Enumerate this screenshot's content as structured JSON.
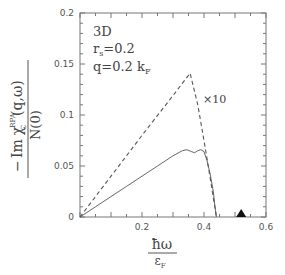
{
  "chart_data": {
    "type": "line",
    "title": "",
    "xlabel": "ħω / ε_F",
    "ylabel": "− Im χ_C^RPA (q,ω) / N(0)",
    "xlim": [
      0,
      0.6
    ],
    "ylim": [
      0,
      0.2
    ],
    "grid": false,
    "x_ticks": [
      "0.2",
      "0.4",
      "0.6"
    ],
    "y_ticks": [
      "0",
      "0.05",
      "0.1",
      "0.15",
      "0.2"
    ],
    "annotations": {
      "line1": "3D",
      "line2_base": "r",
      "line2_sub": "s",
      "line2_rest": "=0.2",
      "line3_base": "q=0.2  k",
      "line3_sub": "F",
      "scale_label": "×10"
    },
    "series": [
      {
        "name": "RPA (solid)",
        "style": "solid",
        "x": [
          0,
          0.05,
          0.1,
          0.15,
          0.2,
          0.25,
          0.3,
          0.33,
          0.345,
          0.36,
          0.37,
          0.38,
          0.39,
          0.4,
          0.41,
          0.42,
          0.43,
          0.435,
          0.44
        ],
        "y": [
          0,
          0.01,
          0.02,
          0.03,
          0.04,
          0.05,
          0.06,
          0.065,
          0.066,
          0.064,
          0.063,
          0.065,
          0.066,
          0.064,
          0.055,
          0.042,
          0.025,
          0.012,
          0
        ]
      },
      {
        "name": "×10 (dashed)",
        "style": "dashed",
        "x": [
          0,
          0.1,
          0.2,
          0.3,
          0.355,
          0.38,
          0.4,
          0.42,
          0.44
        ],
        "y": [
          0,
          0.04,
          0.08,
          0.119,
          0.141,
          0.11,
          0.075,
          0.038,
          0
        ]
      }
    ],
    "markers": [
      {
        "name": "filled-triangle",
        "x": 0.52,
        "y": 0
      }
    ]
  },
  "axis": {
    "x_num": "ħω",
    "x_den_base": "ε",
    "x_den_sub": "F",
    "y_prefix": "−",
    "y_num_im": "Im",
    "y_num_chi": "χ",
    "y_num_sup": "RPA",
    "y_num_sub": "C",
    "y_num_args": "(q,ω)",
    "y_den": "N(0)"
  }
}
